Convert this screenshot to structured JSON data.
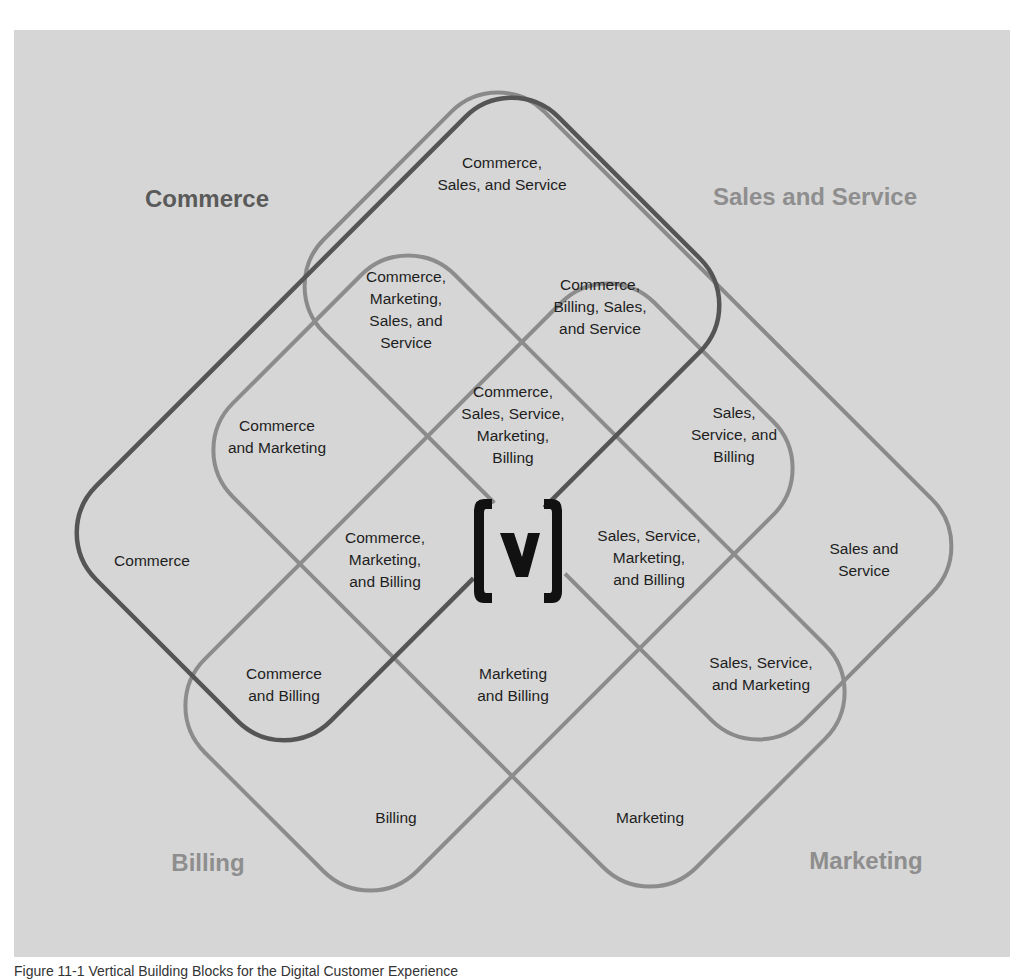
{
  "diagram": {
    "type": "four-set venn (rotated rounded rectangles)",
    "sets": [
      {
        "id": "commerce",
        "label": "Commerce",
        "color": "#555555"
      },
      {
        "id": "sales_service",
        "label": "Sales and Service",
        "color": "#8a8a8a"
      },
      {
        "id": "billing",
        "label": "Billing",
        "color": "#8c8c8c"
      },
      {
        "id": "marketing",
        "label": "Marketing",
        "color": "#8c8c8c"
      }
    ],
    "set_titles": {
      "commerce": "Commerce",
      "sales_service": "Sales and Service",
      "billing": "Billing",
      "marketing": "Marketing"
    },
    "regions": {
      "commerce_sales_service": "Commerce,\nSales, and Service",
      "commerce_marketing_sales_service": "Commerce,\nMarketing,\nSales, and\nService",
      "commerce_billing_sales_service": "Commerce,\nBilling, Sales,\nand Service",
      "commerce_marketing": "Commerce\nand Marketing",
      "all_four": "Commerce,\nSales, Service,\nMarketing,\nBilling",
      "sales_service_billing": "Sales,\nService, and\nBilling",
      "commerce_only": "Commerce",
      "commerce_marketing_billing": "Commerce,\nMarketing,\nand Billing",
      "sales_service_marketing_billing": "Sales, Service,\nMarketing,\nand Billing",
      "sales_service_only": "Sales and\nService",
      "commerce_billing": "Commerce\nand Billing",
      "marketing_billing": "Marketing\nand Billing",
      "sales_service_marketing": "Sales, Service,\nand Marketing",
      "billing_only": "Billing",
      "marketing_only": "Marketing"
    },
    "center_logo": "bracketed-v-logo"
  },
  "caption": "Figure 11-1  Vertical Building Blocks for the Digital Customer Experience",
  "colors": {
    "panel_bg": "#d6d6d6",
    "commerce_stroke": "#555555",
    "other_stroke": "#8a8a8a",
    "commerce_title": "#5a5a5a",
    "other_title": "#8e8e8e",
    "logo": "#111111"
  }
}
